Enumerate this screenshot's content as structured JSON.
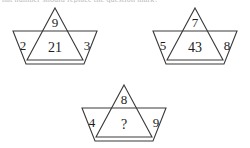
{
  "page": {
    "background_color": "#ffffff",
    "line_color": "#3a3a3a",
    "text_color": "#1d1d1d",
    "partial_top_text": "hat number should replace the question mark?"
  },
  "puzzle": {
    "type": "number-star-sequence",
    "figures": [
      {
        "id": "figure-1",
        "position": "top-left",
        "top": "9",
        "left": "2",
        "center": "21",
        "right": "3"
      },
      {
        "id": "figure-2",
        "position": "top-right",
        "top": "7",
        "left": "5",
        "center": "43",
        "right": "8"
      },
      {
        "id": "figure-3",
        "position": "bottom-center",
        "top": "8",
        "left": "4",
        "center": "?",
        "right": "9"
      }
    ]
  }
}
